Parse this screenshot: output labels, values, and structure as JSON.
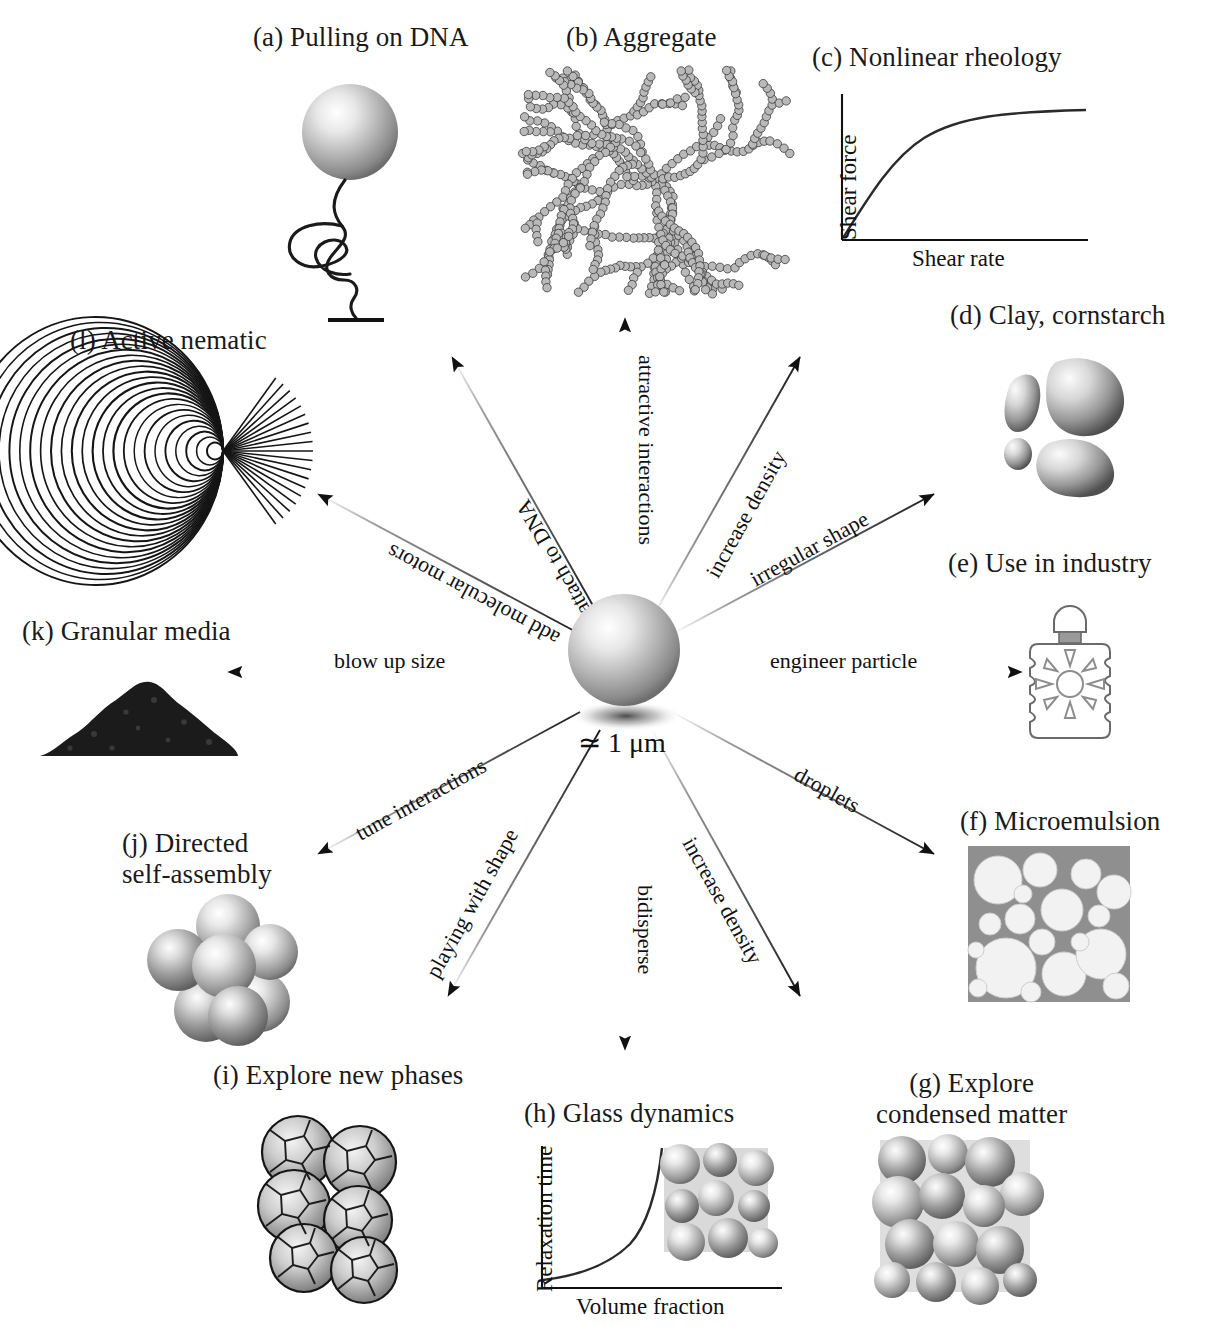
{
  "figure": {
    "center": {
      "scale_label": "≃ 1 μm",
      "particle_name": "colloidal-sphere"
    },
    "panels": [
      {
        "key": "a",
        "label": "(a) Pulling on DNA",
        "art": "bead-tethered-dna"
      },
      {
        "key": "b",
        "label": "(b) Aggregate",
        "art": "fractal-cluster"
      },
      {
        "key": "c",
        "label": "(c) Nonlinear rheology",
        "art": "shear-curve-plot"
      },
      {
        "key": "d",
        "label": "(d) Clay, cornstarch",
        "art": "irregular-grains"
      },
      {
        "key": "e",
        "label": "(e) Use in industry",
        "art": "sunscreen-bottle"
      },
      {
        "key": "f",
        "label": "(f) Microemulsion",
        "art": "emulsion-droplets-micrograph"
      },
      {
        "key": "g",
        "label": "(g) Explore\ncondensed matter",
        "art": "dense-sphere-packing-micrograph"
      },
      {
        "key": "h",
        "label": "(h) Glass dynamics",
        "art": "relaxation-time-plot"
      },
      {
        "key": "i",
        "label": "(i) Explore new phases",
        "art": "faceted-polyhedra-cluster"
      },
      {
        "key": "j",
        "label": "(j) Directed\nself-assembly",
        "art": "sphere-cluster"
      },
      {
        "key": "k",
        "label": "(k) Granular media",
        "art": "granular-pile"
      },
      {
        "key": "l",
        "label": "(l) Active nematic",
        "art": "nematic-defect-lines"
      }
    ],
    "arrows": [
      {
        "id": "attractive-interactions",
        "label": "attractive interactions",
        "angle_deg": -90,
        "target": "b"
      },
      {
        "id": "attach-to-dna",
        "label": "attach to DNA",
        "angle_deg": -125,
        "target": "a"
      },
      {
        "id": "add-molecular-motors",
        "label": "add molecular motors",
        "angle_deg": -152,
        "target": "l"
      },
      {
        "id": "blow-up-size",
        "label": "blow up size",
        "angle_deg": 180,
        "target": "k"
      },
      {
        "id": "tune-interactions",
        "label": "tune interactions",
        "angle_deg": 152,
        "target": "j"
      },
      {
        "id": "playing-with-shape",
        "label": "playing with shape",
        "angle_deg": 118,
        "target": "i"
      },
      {
        "id": "bidisperse",
        "label": "bidisperse",
        "angle_deg": 90,
        "target": "h"
      },
      {
        "id": "increase-density-lower",
        "label": "increase density",
        "angle_deg": 62,
        "target": "g"
      },
      {
        "id": "droplets",
        "label": "droplets",
        "angle_deg": 28,
        "target": "f"
      },
      {
        "id": "engineer-particle",
        "label": "engineer particle",
        "angle_deg": 0,
        "target": "e"
      },
      {
        "id": "irregular-shape",
        "label": "irregular shape",
        "angle_deg": -28,
        "target": "d"
      },
      {
        "id": "increase-density-upper",
        "label": "increase density",
        "angle_deg": -58,
        "target": "c"
      }
    ],
    "plots": {
      "rheology": {
        "caption": "(c) Nonlinear rheology",
        "ylabel": "Shear force",
        "xlabel": "Shear rate"
      },
      "glass": {
        "caption": "(h) Glass dynamics",
        "ylabel": "Relaxation time",
        "xlabel": "Volume fraction"
      }
    }
  },
  "chart_data": [
    {
      "type": "line",
      "id": "nonlinear-rheology",
      "title": "(c) Nonlinear rheology",
      "xlabel": "Shear rate",
      "ylabel": "Shear force",
      "grid": false,
      "legend": "none",
      "xlim": [
        0,
        1
      ],
      "ylim": [
        0,
        1
      ],
      "x": [
        0.0,
        0.08,
        0.16,
        0.24,
        0.32,
        0.42,
        0.52,
        0.62,
        0.72,
        0.84,
        1.0
      ],
      "y": [
        0.0,
        0.22,
        0.41,
        0.56,
        0.67,
        0.77,
        0.84,
        0.88,
        0.91,
        0.93,
        0.94
      ],
      "note": "shear-thinning / saturating response"
    },
    {
      "type": "line",
      "id": "glass-dynamics",
      "title": "(h) Glass dynamics",
      "xlabel": "Volume fraction",
      "ylabel": "Relaxation time",
      "grid": false,
      "legend": "none",
      "xlim": [
        0,
        1
      ],
      "ylim": [
        0,
        1
      ],
      "x": [
        0.0,
        0.15,
        0.3,
        0.45,
        0.58,
        0.68,
        0.76,
        0.83,
        0.88,
        0.92,
        0.95
      ],
      "y": [
        0.04,
        0.06,
        0.1,
        0.16,
        0.24,
        0.33,
        0.46,
        0.62,
        0.78,
        0.9,
        1.0
      ],
      "note": "divergent relaxation time approaching the glass transition"
    }
  ]
}
